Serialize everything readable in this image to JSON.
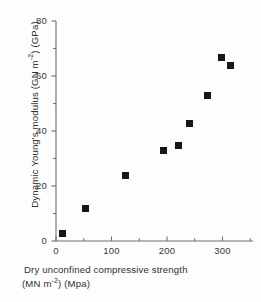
{
  "chart_data": {
    "type": "scatter",
    "title": "",
    "xlabel": "Dry unconfined compressive strength (MN m-2) (Mpa)",
    "ylabel": "Dynamic Young's modulus (GN m-2) (GPa)",
    "xlabel_line1": "Dry unconfined compressive strength",
    "xlabel_line2_prefix": "(MN m",
    "xlabel_line2_exponent": "-2",
    "xlabel_line2_suffix": ") (Mpa)",
    "ylabel_prefix": "Dynamic Young's modulus (GN m",
    "ylabel_exponent": "-2",
    "ylabel_suffix": ") (GPa)",
    "xlim": [
      0,
      355
    ],
    "ylim": [
      0,
      80
    ],
    "xticks": [
      0,
      100,
      200,
      300
    ],
    "yticks": [
      0,
      20,
      40,
      60,
      80
    ],
    "xticks_minor": [
      50,
      150,
      250,
      350
    ],
    "yticks_minor": [
      10,
      30,
      50,
      70
    ],
    "xtick_labels": [
      "0",
      "100",
      "200",
      "300"
    ],
    "ytick_labels": [
      "0",
      "20",
      "40",
      "60",
      "80"
    ],
    "grid": false,
    "legend": null,
    "marker_style": "filled-square",
    "marker_color": "#171717",
    "axis_color": "#6e6e6e",
    "background_color": "#fdfdfd",
    "x": [
      10,
      53,
      124,
      192,
      219,
      240,
      273,
      298,
      314
    ],
    "y": [
      3,
      12,
      24,
      33,
      35,
      43,
      53,
      67,
      64
    ],
    "points": [
      {
        "x": 10,
        "y": 3
      },
      {
        "x": 53,
        "y": 12
      },
      {
        "x": 124,
        "y": 24
      },
      {
        "x": 192,
        "y": 33
      },
      {
        "x": 219,
        "y": 35
      },
      {
        "x": 240,
        "y": 43
      },
      {
        "x": 273,
        "y": 53
      },
      {
        "x": 298,
        "y": 67
      },
      {
        "x": 314,
        "y": 64
      }
    ]
  }
}
